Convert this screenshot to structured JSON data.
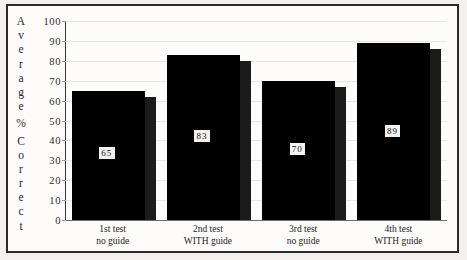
{
  "chart_data": {
    "type": "bar",
    "title": "",
    "xlabel": "",
    "ylabel": "Average % Correct",
    "ylim": [
      0,
      100
    ],
    "grid": true,
    "legend": "none",
    "categories": [
      "1st test no guide",
      "2nd test WITH guide",
      "3rd test no guide",
      "4th test WITH guide"
    ],
    "values": [
      65,
      83,
      70,
      89
    ],
    "yticks": [
      100,
      90,
      80,
      70,
      60,
      50,
      40,
      30,
      20,
      10,
      0
    ],
    "bars": [
      {
        "label_line1": "1st test",
        "label_line2": "no guide",
        "value": 65,
        "value_label": "65"
      },
      {
        "label_line1": "2nd test",
        "label_line2": "WITH guide",
        "value": 83,
        "value_label": "83"
      },
      {
        "label_line1": "3rd test",
        "label_line2": "no guide",
        "value": 70,
        "value_label": "70"
      },
      {
        "label_line1": "4th test",
        "label_line2": "WITH guide",
        "value": 89,
        "value_label": "89"
      }
    ]
  },
  "axis": {
    "y_title_chars": [
      "A",
      "v",
      "e",
      "r",
      "a",
      "g",
      "e",
      "",
      "%",
      "",
      "C",
      "o",
      "r",
      "r",
      "e",
      "c",
      "t"
    ],
    "y_title_text": "Average % Correct"
  },
  "colors": {
    "bar_face": "#000000",
    "bar_side": "#1b1b1b",
    "value_box_bg": "#f4f3f1",
    "value_box_text": "#121212",
    "frame": "#2b2b2b",
    "page_background": "#f2f1ef",
    "plot_background": "#fdfcfb",
    "gridline": "#e8e6e2",
    "axis_line": "#3a3a3a",
    "text": "#2a2a2a"
  }
}
